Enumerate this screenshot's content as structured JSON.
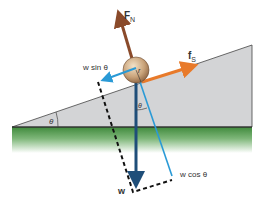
{
  "diagram": {
    "labels": {
      "normal_force": "F",
      "normal_force_sub": "N",
      "friction": "f",
      "friction_sub": "S",
      "w_sin": "w sin θ",
      "w_cos": "w cos θ",
      "weight": "w",
      "angle_incline": "θ",
      "angle_vertical": "θ",
      "radius": "r"
    },
    "colors": {
      "incline": "#d3d4d6",
      "ground": "#3f8a3c",
      "normal_force": "#8a4a2a",
      "friction": "#e87a2a",
      "weight": "#1f4e79",
      "components": "#2a9ad6",
      "ball": "#c9a37a"
    }
  }
}
